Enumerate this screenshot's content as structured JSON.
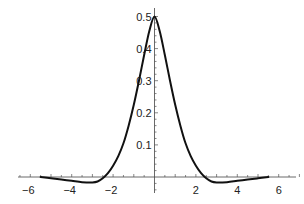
{
  "chart_data": {
    "type": "line",
    "title": "",
    "xlabel": "",
    "ylabel": "",
    "xlim": [
      -6.5,
      7
    ],
    "ylim": [
      -0.03,
      0.52
    ],
    "grid": false,
    "legend": null,
    "x_ticks": [
      -6,
      -4,
      -2,
      2,
      4,
      6
    ],
    "x_tick_labels": [
      "−6",
      "−4",
      "−2",
      "2",
      "4",
      "6"
    ],
    "y_ticks": [
      0.1,
      0.2,
      0.3,
      0.4,
      0.5
    ],
    "y_tick_labels": [
      "0.1",
      "0.2",
      "0.3",
      "0.4",
      "0.5"
    ],
    "series": [
      {
        "name": "f(x)",
        "color": "#111111",
        "x": [
          -5.5,
          -5.0,
          -4.5,
          -4.0,
          -3.5,
          -3.0,
          -2.75,
          -2.5,
          -2.25,
          -2.0,
          -1.75,
          -1.5,
          -1.25,
          -1.0,
          -0.75,
          -0.5,
          -0.25,
          0.0,
          0.25,
          0.5,
          0.75,
          1.0,
          1.25,
          1.5,
          1.75,
          2.0,
          2.25,
          2.5,
          2.75,
          3.0,
          3.5,
          4.0,
          4.5,
          5.0,
          5.5
        ],
        "y": [
          0.0,
          -0.004,
          -0.008,
          -0.012,
          -0.016,
          -0.017,
          -0.014,
          -0.004,
          0.012,
          0.035,
          0.065,
          0.105,
          0.16,
          0.225,
          0.3,
          0.38,
          0.455,
          0.5,
          0.455,
          0.38,
          0.3,
          0.225,
          0.16,
          0.105,
          0.065,
          0.035,
          0.012,
          -0.004,
          -0.014,
          -0.017,
          -0.016,
          -0.012,
          -0.008,
          -0.004,
          0.0
        ]
      }
    ]
  }
}
